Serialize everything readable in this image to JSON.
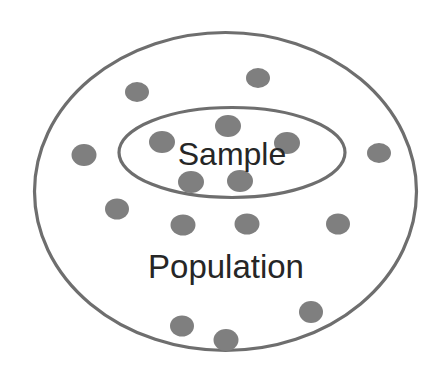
{
  "diagram": {
    "type": "venn-nested-set",
    "background_color": "#ffffff",
    "outline_color": "#6e6e6e",
    "dot_color": "#7f7f7f",
    "label_color": "#262626",
    "sets": [
      {
        "id": "population",
        "label": "Population",
        "shape": "ellipse",
        "cx": 225.5,
        "cy": 191.5,
        "rx": 191,
        "ry": 159,
        "stroke_width": 3.2,
        "label_x": 226,
        "label_y": 269,
        "label_font_size": 33
      },
      {
        "id": "sample",
        "label": "Sample",
        "shape": "ellipse",
        "cx": 232,
        "cy": 152.5,
        "rx": 113,
        "ry": 45,
        "stroke_width": 3.2,
        "label_x": 232,
        "label_y": 157,
        "label_font_size": 32
      }
    ],
    "dots": [
      {
        "id": "dot-pop-1",
        "set": "population",
        "cx": 137,
        "cy": 92,
        "rx": 12,
        "ry": 10
      },
      {
        "id": "dot-pop-2",
        "set": "population",
        "cx": 258,
        "cy": 78,
        "rx": 12,
        "ry": 10
      },
      {
        "id": "dot-pop-3",
        "set": "population",
        "cx": 84,
        "cy": 155,
        "rx": 12.5,
        "ry": 11
      },
      {
        "id": "dot-pop-4",
        "set": "population",
        "cx": 379,
        "cy": 153,
        "rx": 12,
        "ry": 10
      },
      {
        "id": "dot-pop-5",
        "set": "population",
        "cx": 117,
        "cy": 209,
        "rx": 12,
        "ry": 10.5
      },
      {
        "id": "dot-pop-6",
        "set": "population",
        "cx": 183,
        "cy": 225,
        "rx": 12.5,
        "ry": 10.5
      },
      {
        "id": "dot-pop-7",
        "set": "population",
        "cx": 247,
        "cy": 224,
        "rx": 12.5,
        "ry": 10.5
      },
      {
        "id": "dot-pop-8",
        "set": "population",
        "cx": 338,
        "cy": 224,
        "rx": 12,
        "ry": 10.5
      },
      {
        "id": "dot-pop-9",
        "set": "population",
        "cx": 311,
        "cy": 312,
        "rx": 12,
        "ry": 11
      },
      {
        "id": "dot-pop-10",
        "set": "population",
        "cx": 182,
        "cy": 326,
        "rx": 12,
        "ry": 10.5
      },
      {
        "id": "dot-pop-11",
        "set": "population",
        "cx": 226,
        "cy": 340,
        "rx": 12.5,
        "ry": 11
      },
      {
        "id": "dot-sam-1",
        "set": "sample",
        "cx": 228,
        "cy": 126,
        "rx": 13,
        "ry": 11
      },
      {
        "id": "dot-sam-2",
        "set": "sample",
        "cx": 162,
        "cy": 142,
        "rx": 13,
        "ry": 11
      },
      {
        "id": "dot-sam-3",
        "set": "sample",
        "cx": 287,
        "cy": 143,
        "rx": 13,
        "ry": 11
      },
      {
        "id": "dot-sam-4",
        "set": "sample",
        "cx": 191,
        "cy": 182,
        "rx": 13,
        "ry": 11
      },
      {
        "id": "dot-sam-5",
        "set": "sample",
        "cx": 240,
        "cy": 181,
        "rx": 13,
        "ry": 11
      }
    ],
    "counts": {
      "total_dots": 16,
      "sample_dots": 5,
      "population_only_dots": 11
    }
  }
}
